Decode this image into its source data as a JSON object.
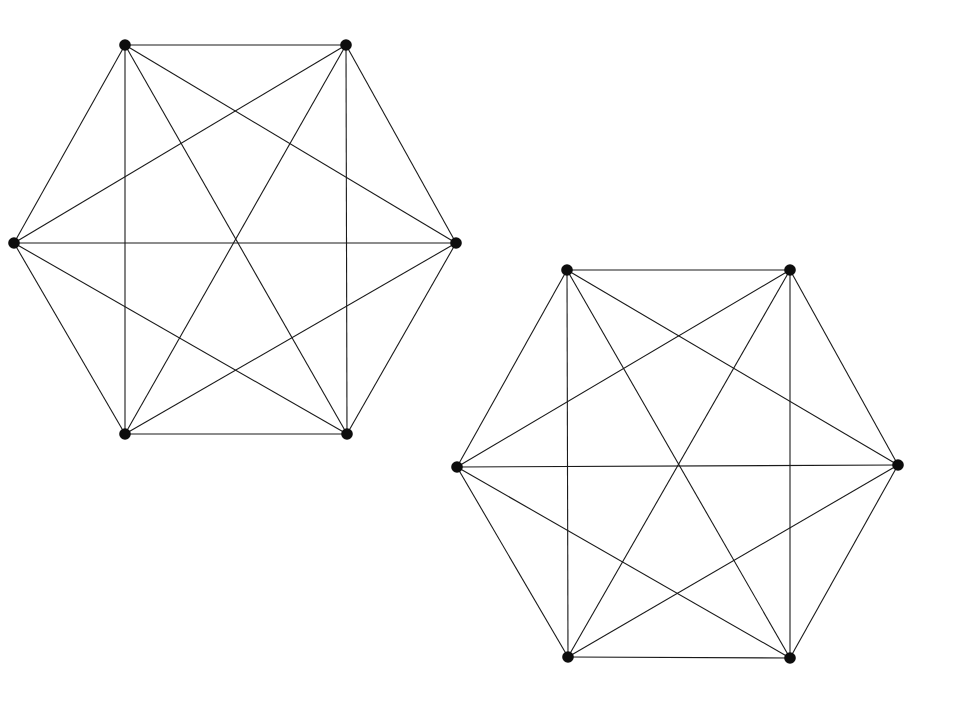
{
  "canvas": {
    "width": 970,
    "height": 705,
    "background_color": "#ffffff"
  },
  "style": {
    "edge_color": "#1a1a1a",
    "edge_width": 1.1,
    "vertex_color": "#0d0d0d",
    "vertex_radius": 5.8
  },
  "chart_data": {
    "type": "diagram",
    "title": "",
    "subtitle": "",
    "graphs": [
      {
        "name": "left-k6",
        "label": "K6 (left)",
        "vertex_count": 6,
        "edge_count": 15,
        "vertices": [
          {
            "id": "L0",
            "label": "top-left",
            "x": 125,
            "y": 45
          },
          {
            "id": "L1",
            "label": "top-right",
            "x": 346,
            "y": 45
          },
          {
            "id": "L2",
            "label": "right",
            "x": 456,
            "y": 243
          },
          {
            "id": "L3",
            "label": "bottom-right",
            "x": 347,
            "y": 434
          },
          {
            "id": "L4",
            "label": "bottom-left",
            "x": 125,
            "y": 434
          },
          {
            "id": "L5",
            "label": "left",
            "x": 14,
            "y": 243
          }
        ],
        "edges": [
          [
            0,
            1
          ],
          [
            0,
            2
          ],
          [
            0,
            3
          ],
          [
            0,
            4
          ],
          [
            0,
            5
          ],
          [
            1,
            2
          ],
          [
            1,
            3
          ],
          [
            1,
            4
          ],
          [
            1,
            5
          ],
          [
            2,
            3
          ],
          [
            2,
            4
          ],
          [
            2,
            5
          ],
          [
            3,
            4
          ],
          [
            3,
            5
          ],
          [
            4,
            5
          ]
        ]
      },
      {
        "name": "right-k6",
        "label": "K6 (right)",
        "vertex_count": 6,
        "edge_count": 15,
        "vertices": [
          {
            "id": "R0",
            "label": "top-left",
            "x": 567,
            "y": 270
          },
          {
            "id": "R1",
            "label": "top-right",
            "x": 790,
            "y": 270
          },
          {
            "id": "R2",
            "label": "right",
            "x": 898,
            "y": 465
          },
          {
            "id": "R3",
            "label": "bottom-right",
            "x": 790,
            "y": 658
          },
          {
            "id": "R4",
            "label": "bottom-left",
            "x": 568,
            "y": 657
          },
          {
            "id": "R5",
            "label": "left",
            "x": 457,
            "y": 467
          }
        ],
        "edges": [
          [
            0,
            1
          ],
          [
            0,
            2
          ],
          [
            0,
            3
          ],
          [
            0,
            4
          ],
          [
            0,
            5
          ],
          [
            1,
            2
          ],
          [
            1,
            3
          ],
          [
            1,
            4
          ],
          [
            1,
            5
          ],
          [
            2,
            3
          ],
          [
            2,
            4
          ],
          [
            2,
            5
          ],
          [
            3,
            4
          ],
          [
            3,
            5
          ],
          [
            4,
            5
          ]
        ]
      }
    ]
  }
}
